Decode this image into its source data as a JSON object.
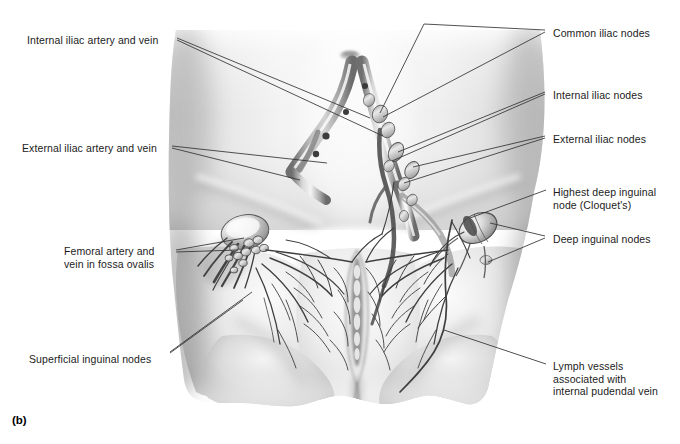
{
  "figure": {
    "caption": "(b)",
    "style": "grayscale medical airbrush illustration",
    "background_color": "#ffffff",
    "ink_color": "#1b1b1b",
    "leader_color": "#3a3a3a"
  },
  "labels": {
    "left": [
      {
        "id": "internal-iliac-artery-and-vein",
        "text": "Internal iliac artery and vein",
        "x": 27,
        "y": 34,
        "align": "left",
        "leaders": [
          {
            "from": [
              177,
              38
            ],
            "to": [
              370,
              118
            ]
          },
          {
            "from": [
              177,
              39
            ],
            "to": [
              383,
              135
            ]
          }
        ]
      },
      {
        "id": "external-iliac-artery-and-vein",
        "text": "External iliac artery and vein",
        "x": 22,
        "y": 142,
        "align": "left",
        "leaders": [
          {
            "from": [
              172,
              146
            ],
            "to": [
              327,
              163
            ]
          },
          {
            "from": [
              172,
              147
            ],
            "to": [
              300,
              180
            ]
          }
        ]
      },
      {
        "id": "femoral-artery-and-vein-in-fossa-ovalis",
        "text": "Femoral artery and\nvein in fossa ovalis",
        "x": 64,
        "y": 245,
        "align": "left",
        "leaders": [
          {
            "from": [
              176,
              250
            ],
            "to": [
              244,
              238
            ]
          },
          {
            "from": [
              176,
              251
            ],
            "to": [
              238,
              250
            ]
          }
        ]
      },
      {
        "id": "superficial-inguinal-nodes",
        "text": "Superficial inguinal nodes",
        "x": 29,
        "y": 353,
        "align": "left",
        "leaders": [
          {
            "from": [
              170,
              352
            ],
            "to": [
              252,
              292
            ]
          },
          {
            "from": [
              170,
              353
            ],
            "to": [
              243,
              300
            ]
          }
        ]
      }
    ],
    "right": [
      {
        "id": "common-iliac-nodes",
        "text": "Common iliac nodes",
        "x": 553,
        "y": 27,
        "align": "left",
        "leaders": [
          {
            "from": [
              545,
              30
            ],
            "to": [
              424,
              24
            ],
            "elbow": [
              380,
              113
            ]
          },
          {
            "from": [
              545,
              31
            ],
            "to": [
              383,
              116
            ]
          }
        ]
      },
      {
        "id": "internal-iliac-nodes",
        "text": "Internal iliac nodes",
        "x": 553,
        "y": 89,
        "align": "left",
        "leaders": [
          {
            "from": [
              545,
              92
            ],
            "to": [
              398,
              152
            ]
          },
          {
            "from": [
              545,
              93
            ],
            "to": [
              392,
              160
            ]
          }
        ]
      },
      {
        "id": "external-iliac-nodes",
        "text": "External iliac nodes",
        "x": 553,
        "y": 133,
        "align": "left",
        "leaders": [
          {
            "from": [
              545,
              136
            ],
            "to": [
              413,
              166
            ]
          },
          {
            "from": [
              545,
              137
            ],
            "to": [
              404,
              182
            ]
          }
        ]
      },
      {
        "id": "highest-deep-inguinal-node-cloquets",
        "text": "Highest deep inguinal\nnode (Cloquet's)",
        "x": 553,
        "y": 186,
        "align": "left",
        "leaders": [
          {
            "from": [
              546,
              190
            ],
            "to": [
              470,
              218
            ]
          }
        ]
      },
      {
        "id": "deep-inguinal-nodes",
        "text": "Deep inguinal nodes",
        "x": 553,
        "y": 233,
        "align": "left",
        "leaders": [
          {
            "from": [
              545,
              236
            ],
            "to": [
              490,
              223
            ]
          },
          {
            "from": [
              545,
              237
            ],
            "to": [
              488,
              262
            ]
          }
        ]
      },
      {
        "id": "lymph-vessels-associated-with-internal-pudendal-vein",
        "text": "Lymph vessels\nassociated with\ninternal pudendal vein",
        "x": 553,
        "y": 360,
        "align": "left",
        "leaders": [
          {
            "from": [
              546,
              364
            ],
            "to": [
              444,
              330
            ]
          }
        ]
      }
    ]
  }
}
